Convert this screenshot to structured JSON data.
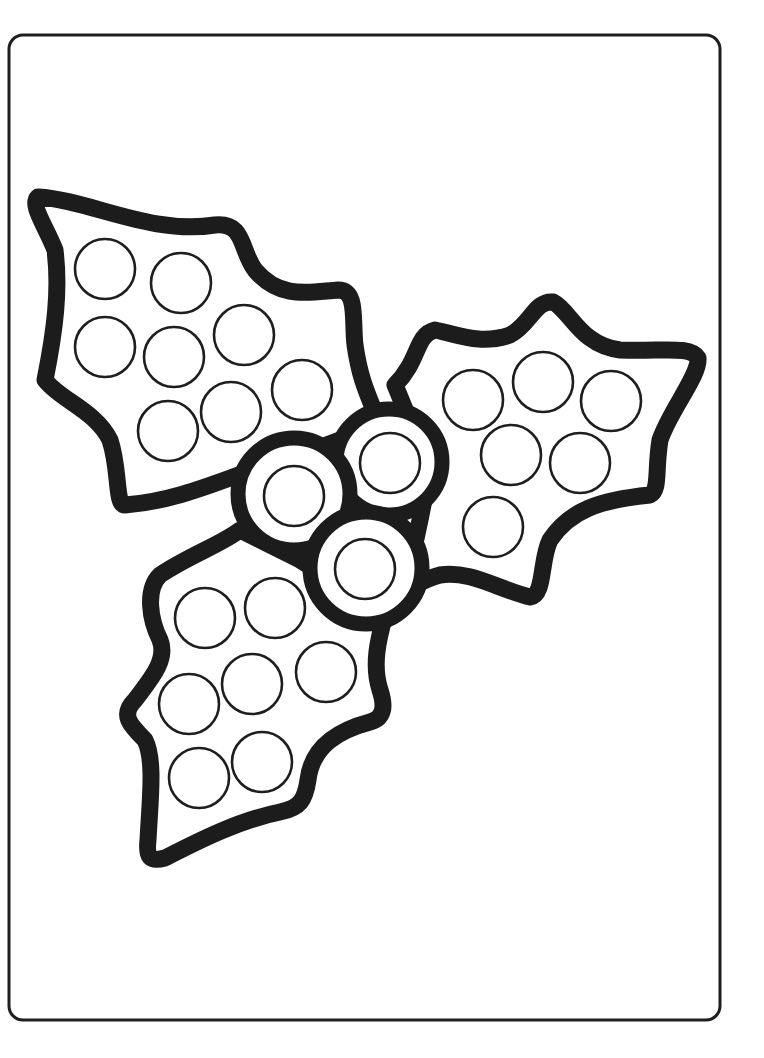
{
  "page": {
    "title": "Holly dot marker coloring page",
    "background": "#ffffff",
    "ink_color": "#1c1c1c",
    "border": {
      "x": 9,
      "y": 35,
      "width": 711,
      "height": 985,
      "radius": 14
    }
  },
  "leaves": [
    {
      "name": "top-left-leaf",
      "path": "M 38 197 C 90 200 150 235 215 225 C 245 222 240 250 255 270 C 280 300 310 292 338 290 C 358 290 352 320 355 345 C 360 380 368 395 378 420 L 340 440 L 300 455 C 240 470 190 500 125 505 C 115 505 120 470 110 440 C 95 410 60 400 45 380 C 55 330 60 290 55 250 C 45 225 30 205 38 197 Z",
      "dots": [
        {
          "cx": 105,
          "cy": 269,
          "r": 30
        },
        {
          "cx": 181,
          "cy": 283,
          "r": 30
        },
        {
          "cx": 105,
          "cy": 347,
          "r": 30
        },
        {
          "cx": 174,
          "cy": 357,
          "r": 30
        },
        {
          "cx": 244,
          "cy": 335,
          "r": 30
        },
        {
          "cx": 302,
          "cy": 390,
          "r": 30
        },
        {
          "cx": 168,
          "cy": 431,
          "r": 30
        },
        {
          "cx": 231,
          "cy": 412,
          "r": 30
        }
      ]
    },
    {
      "name": "right-leaf",
      "path": "M 395 385 C 420 360 415 335 435 330 C 460 335 480 345 510 335 C 530 325 535 300 553 302 C 570 310 580 345 620 350 C 660 352 690 345 698 358 C 700 375 670 410 660 440 C 655 470 660 490 650 495 C 600 500 570 510 550 540 C 540 560 545 595 530 597 C 500 590 470 570 440 575 C 420 580 410 590 405 590 L 420 520 L 430 470 Z",
      "dots": [
        {
          "cx": 473,
          "cy": 400,
          "r": 30
        },
        {
          "cx": 543,
          "cy": 382,
          "r": 30
        },
        {
          "cx": 611,
          "cy": 401,
          "r": 30
        },
        {
          "cx": 511,
          "cy": 455,
          "r": 30
        },
        {
          "cx": 580,
          "cy": 463,
          "r": 30
        },
        {
          "cx": 493,
          "cy": 527,
          "r": 30
        }
      ]
    },
    {
      "name": "bottom-leaf",
      "path": "M 240 530 C 220 545 190 555 160 575 C 145 590 150 620 160 640 C 168 660 150 680 135 700 C 120 715 130 725 145 740 C 155 760 150 800 148 840 C 146 858 150 862 165 858 C 200 840 240 820 280 812 C 300 808 305 800 308 780 C 312 745 340 730 370 722 C 385 718 385 705 380 690 C 372 665 378 640 385 615 L 340 585 L 300 560 Z",
      "dots": [
        {
          "cx": 205,
          "cy": 618,
          "r": 30
        },
        {
          "cx": 275,
          "cy": 608,
          "r": 30
        },
        {
          "cx": 189,
          "cy": 704,
          "r": 30
        },
        {
          "cx": 252,
          "cy": 684,
          "r": 30
        },
        {
          "cx": 326,
          "cy": 672,
          "r": 30
        },
        {
          "cx": 199,
          "cy": 778,
          "r": 30
        },
        {
          "cx": 262,
          "cy": 762,
          "r": 30
        }
      ]
    }
  ],
  "berries": [
    {
      "name": "berry-top-right",
      "cx": 389,
      "cy": 462,
      "r": 53,
      "dot": {
        "cx": 390,
        "cy": 463,
        "r": 30
      }
    },
    {
      "name": "berry-left",
      "cx": 294,
      "cy": 494,
      "r": 56,
      "dot": {
        "cx": 294,
        "cy": 496,
        "r": 30
      }
    },
    {
      "name": "berry-bottom",
      "cx": 366,
      "cy": 568,
      "r": 56,
      "dot": {
        "cx": 365,
        "cy": 569,
        "r": 30
      }
    }
  ],
  "summary": {
    "total_dots": 24,
    "leaf_count": 3,
    "berry_count": 3
  }
}
